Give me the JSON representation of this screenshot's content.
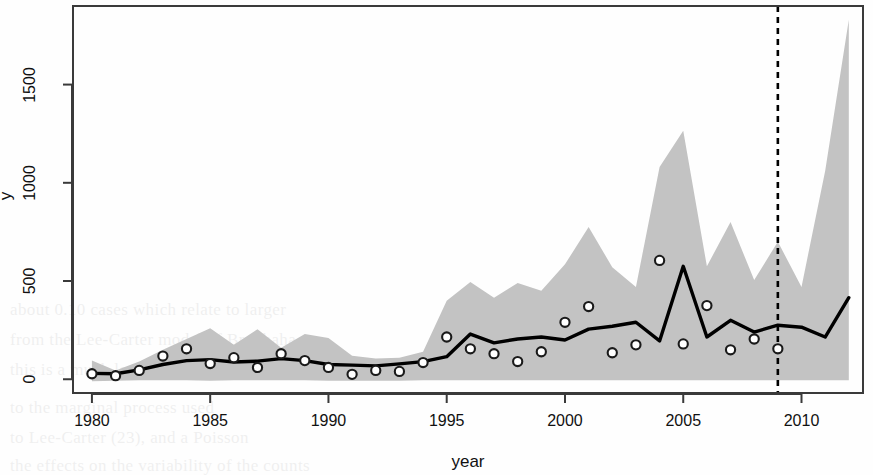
{
  "figure": {
    "background": "#fefefe",
    "band_color": "#c3c3c3",
    "line_color": "#000000",
    "point_color": "#1a1a1a",
    "frame_color": "#3a3a3a"
  },
  "axes": {
    "xlabel": "year",
    "ylabel": "y",
    "x_ticks": [
      1980,
      1985,
      1990,
      1995,
      2000,
      2005,
      2010
    ],
    "y_ticks": [
      0,
      500,
      1000,
      1500
    ],
    "x_tick_labels": [
      "1980",
      "1985",
      "1990",
      "1995",
      "2000",
      "2005",
      "2010"
    ],
    "y_tick_labels": [
      "0",
      "500",
      "1000",
      "1500"
    ],
    "xlim": [
      1979.2,
      2012.6
    ],
    "ylim": [
      -70,
      1900
    ]
  },
  "annotations": {
    "cutoff_line": {
      "x": 2009,
      "style": "dashed",
      "color": "#000000"
    }
  },
  "chart_data": {
    "type": "line",
    "title": "",
    "xlabel": "year",
    "ylabel": "y",
    "xlim": [
      1979.2,
      2012.6
    ],
    "ylim": [
      -70,
      1900
    ],
    "grid": false,
    "legend": null,
    "x": [
      1980,
      1981,
      1982,
      1983,
      1984,
      1985,
      1986,
      1987,
      1988,
      1989,
      1990,
      1991,
      1992,
      1993,
      1994,
      1995,
      1996,
      1997,
      1998,
      1999,
      2000,
      2001,
      2002,
      2003,
      2004,
      2005,
      2006,
      2007,
      2008,
      2009,
      2010,
      2011,
      2012
    ],
    "series": [
      {
        "name": "fitted",
        "type": "line",
        "values": [
          30,
          28,
          48,
          75,
          95,
          100,
          88,
          92,
          105,
          95,
          75,
          72,
          68,
          78,
          90,
          115,
          230,
          185,
          205,
          215,
          200,
          255,
          270,
          290,
          195,
          575,
          215,
          300,
          240,
          275,
          265,
          215,
          415
        ]
      },
      {
        "name": "observed",
        "type": "scatter",
        "marker": "open-circle",
        "values": [
          28,
          18,
          45,
          118,
          155,
          80,
          110,
          60,
          130,
          95,
          60,
          25,
          45,
          40,
          85,
          215,
          155,
          130,
          90,
          140,
          290,
          370,
          135,
          175,
          605,
          180,
          375,
          150,
          205,
          155,
          null,
          null,
          null
        ]
      }
    ],
    "band": {
      "name": "prediction interval",
      "fill": "#c3c3c3",
      "lower": [
        -10,
        -8,
        -5,
        -5,
        -5,
        -8,
        -5,
        -5,
        -5,
        -5,
        -8,
        -8,
        -8,
        -8,
        -5,
        -5,
        -5,
        -5,
        -5,
        -5,
        -5,
        -5,
        -5,
        -5,
        -5,
        -5,
        -5,
        -5,
        -5,
        -5,
        -5,
        -5,
        -5
      ],
      "upper": [
        95,
        45,
        90,
        150,
        205,
        260,
        175,
        255,
        160,
        230,
        210,
        120,
        105,
        110,
        140,
        400,
        495,
        415,
        490,
        450,
        585,
        775,
        570,
        470,
        1080,
        1265,
        575,
        800,
        505,
        700,
        470,
        1060,
        1830
      ]
    }
  },
  "bleed_text": {
    "lines": [
      "and (1)",
      "(2)",
      "3)",
      "and (4)",
      "",
      "",
      "about 0.10 cases which relate to larger",
      "from the Lee-Carter model of Brouhaha",
      "this is a much less flexible model, and",
      "to the marginal process used",
      "to Lee-Carter (23), and a Poisson",
      "the effects on the variability of the counts"
    ]
  }
}
